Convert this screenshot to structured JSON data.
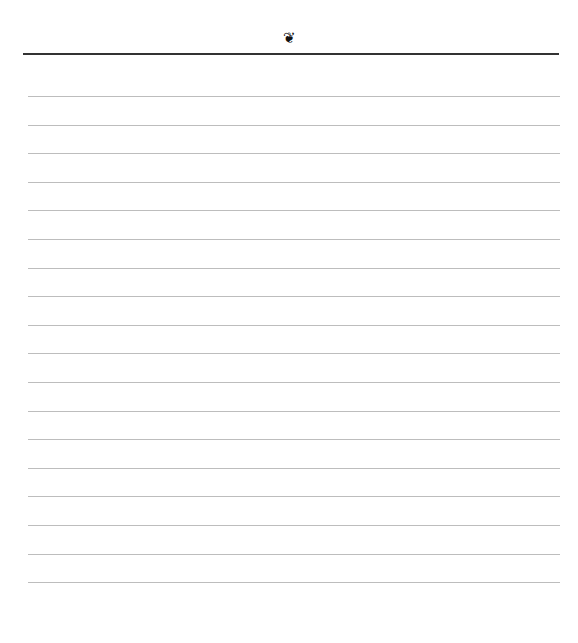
{
  "header": {
    "ornament": "❦"
  },
  "ruled_lines": {
    "count": 18
  },
  "colors": {
    "rule": "#333333",
    "line": "#bdbdbd",
    "paper": "#ffffff"
  }
}
